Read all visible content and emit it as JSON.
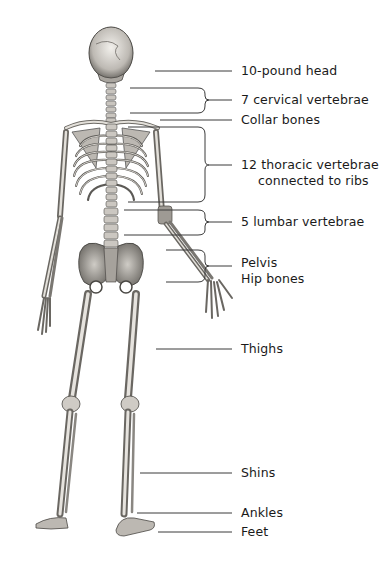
{
  "diagram": {
    "type": "labeled anatomical illustration",
    "labels": [
      {
        "id": "head",
        "text": "10-pound head",
        "x": 241,
        "y": 63
      },
      {
        "id": "cervical",
        "text": "7 cervical vertebrae",
        "x": 241,
        "y": 92
      },
      {
        "id": "collar",
        "text": "Collar bones",
        "x": 241,
        "y": 112
      },
      {
        "id": "thoracic",
        "text": "12 thoracic vertebrae",
        "text2": "connected to ribs",
        "x": 241,
        "y": 158
      },
      {
        "id": "lumbar",
        "text": "5 lumbar vertebrae",
        "x": 241,
        "y": 214
      },
      {
        "id": "pelvis",
        "text": "Pelvis",
        "x": 241,
        "y": 256
      },
      {
        "id": "hip",
        "text": "Hip bones",
        "x": 241,
        "y": 271
      },
      {
        "id": "thighs",
        "text": "Thighs",
        "x": 241,
        "y": 342
      },
      {
        "id": "shins",
        "text": "Shins",
        "x": 241,
        "y": 466
      },
      {
        "id": "ankles",
        "text": "Ankles",
        "x": 241,
        "y": 506
      },
      {
        "id": "feet",
        "text": "Feet",
        "x": 241,
        "y": 525
      }
    ],
    "colors": {
      "ink": "#1a1a1a",
      "bone": "#d9d6d0",
      "bone_shadow": "#8a8782",
      "line": "#333333",
      "background": "#ffffff"
    }
  }
}
